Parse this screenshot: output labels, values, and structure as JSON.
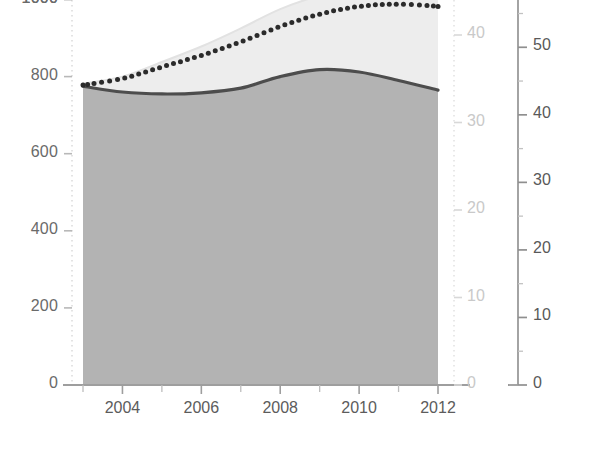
{
  "chart_data": {
    "type": "area",
    "title": "",
    "subtitle": "",
    "xlabel": "",
    "ylabel": "",
    "grid": false,
    "legend_position": "none",
    "x": [
      2003,
      2004,
      2005,
      2006,
      2007,
      2008,
      2009,
      2010,
      2011,
      2012
    ],
    "x_tick_labels": [
      "2004",
      "2006",
      "2008",
      "2010",
      "2012"
    ],
    "x_tick_values": [
      2004,
      2006,
      2008,
      2010,
      2012
    ],
    "xlim": [
      2003,
      2012
    ],
    "axes": [
      {
        "id": "axis-left",
        "position": "left",
        "color": "#6a6a6a",
        "ylim": [
          0,
          1000
        ],
        "ticks": [
          0,
          200,
          400,
          600,
          800,
          1000
        ],
        "tick_labels": [
          "0",
          "200",
          "400",
          "600",
          "800",
          "1000"
        ],
        "label": ""
      },
      {
        "id": "axis-right-inner",
        "position": "right",
        "color": "#c9c9c9",
        "ylim": [
          0,
          44
        ],
        "ticks": [
          0,
          10,
          20,
          30,
          40
        ],
        "tick_labels": [
          "0",
          "10",
          "20",
          "30",
          "40"
        ],
        "label": ""
      },
      {
        "id": "axis-right-outer",
        "position": "right",
        "color": "#595959",
        "ylim": [
          0,
          57
        ],
        "ticks": [
          0,
          10,
          20,
          30,
          40,
          50
        ],
        "tick_labels": [
          "0",
          "10",
          "20",
          "30",
          "40",
          "50"
        ],
        "label": ""
      }
    ],
    "series": [
      {
        "name": "filled-area-dark",
        "style": "area-solid-line",
        "axis": "axis-left",
        "fill_color": "#b3b3b3",
        "line_color": "#4d4d4d",
        "values": [
          775,
          760,
          755,
          758,
          770,
          800,
          818,
          812,
          790,
          765
        ]
      },
      {
        "name": "filled-area-light",
        "style": "area-light",
        "axis": "axis-left",
        "fill_color": "#ededed",
        "line_color": "#e2e2e2",
        "values": [
          782,
          800,
          838,
          878,
          925,
          975,
          1010,
          1030,
          1032,
          1022
        ]
      },
      {
        "name": "dotted-line",
        "style": "dotted",
        "axis": "axis-left",
        "line_color": "#2b2b2b",
        "values": [
          778,
          795,
          825,
          855,
          890,
          930,
          962,
          982,
          988,
          982
        ]
      }
    ]
  },
  "notes": {
    "top_label_clipped": "1000"
  }
}
